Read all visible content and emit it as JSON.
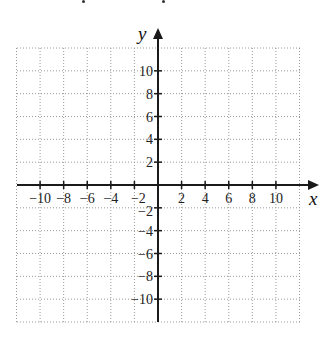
{
  "chart_data": {
    "type": "scatter",
    "title": "",
    "xlabel": "x",
    "ylabel": "y",
    "xlim": [
      -12,
      12
    ],
    "ylim": [
      -12,
      12
    ],
    "grid": true,
    "grid_step": 2,
    "grid_style": "dotted",
    "x_ticks": [
      -10,
      -8,
      -6,
      -4,
      -2,
      2,
      4,
      6,
      8,
      10
    ],
    "y_ticks": [
      -10,
      -8,
      -6,
      -4,
      -2,
      2,
      4,
      6,
      8,
      10
    ],
    "x_tick_labels": [
      "−10",
      "−8",
      "−6",
      "−4",
      "−2",
      "2",
      "4",
      "6",
      "8",
      "10"
    ],
    "y_tick_labels": [
      "−10",
      "−8",
      "−6",
      "−4",
      "−2",
      "2",
      "4",
      "6",
      "8",
      "10"
    ],
    "series": [],
    "colors": {
      "axis": "#1a1a1a",
      "grid": "#9a9a9a",
      "background": "#ffffff"
    }
  }
}
